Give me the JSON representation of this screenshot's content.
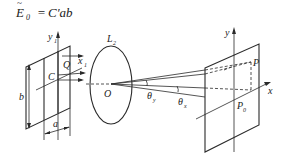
{
  "formula": {
    "lhs_symbol": "E",
    "lhs_subscript": "0",
    "lhs_accent": "~",
    "equals": "=",
    "rhs": "C′ab"
  },
  "aperture": {
    "y_axis_label": "y",
    "y_axis_subscript": "1",
    "x_axis_label": "x",
    "x_axis_subscript": "1",
    "center_label": "C",
    "point_label": "Q",
    "width_label": "a",
    "height_label": "b"
  },
  "lens": {
    "label": "L",
    "label_subscript": "2",
    "center_label": "O"
  },
  "angles": {
    "theta_first": "θ",
    "theta_first_subscript": "y",
    "theta_second": "θ",
    "theta_second_subscript": "x"
  },
  "screen": {
    "y_axis_label": "y",
    "x_axis_label": "x",
    "point_label": "P",
    "origin_point_label": "P",
    "origin_point_subscript": "0"
  },
  "colors": {
    "stroke": "#2a2a2a",
    "background": "#ffffff"
  }
}
